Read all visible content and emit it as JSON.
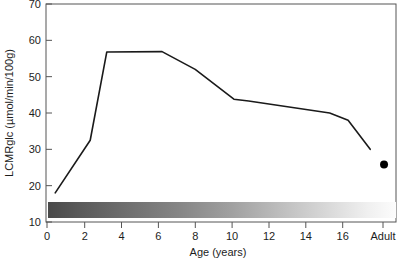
{
  "chart_data": {
    "type": "line",
    "title": "",
    "subtitle": "",
    "xlabel": "Age (years)",
    "ylabel": "LCMRglc (µmol/min/100g)",
    "xlim": [
      0,
      19
    ],
    "ylim": [
      10,
      70
    ],
    "grid": false,
    "legend": null,
    "x_tick_labels": [
      "0",
      "2",
      "4",
      "6",
      "8",
      "10",
      "12",
      "14",
      "16",
      "Adult"
    ],
    "x_tick_values": [
      0,
      2,
      4,
      6,
      8,
      10,
      12,
      14,
      16,
      18.2
    ],
    "y_tick_labels": [
      "10",
      "20",
      "30",
      "40",
      "50",
      "60",
      "70"
    ],
    "y_tick_values": [
      10,
      20,
      30,
      40,
      50,
      60,
      70
    ],
    "series": [
      {
        "name": "LCMRglc developmental curve",
        "style": "line",
        "color": "#1a1a1a",
        "x": [
          0.5,
          2.4,
          3.3,
          6.3,
          8.1,
          10.2,
          11.0,
          15.4,
          16.4,
          17.6
        ],
        "values": [
          18.0,
          32.5,
          56.8,
          56.9,
          52.0,
          43.8,
          43.3,
          40.0,
          38.0,
          30.0
        ]
      },
      {
        "name": "Adult value",
        "style": "point",
        "color": "#000000",
        "x": [
          18.35
        ],
        "values": [
          25.8
        ]
      }
    ],
    "annotations": [
      {
        "name": "myelination-gradient-bar",
        "type": "horizontal-gradient-band",
        "x_start": 0.0,
        "x_end": 18.9,
        "y_center": 14.4,
        "y_thickness": 3.0,
        "color_start": "#4f4f4f",
        "color_mid": "#9a9a9a",
        "color_end": "#fbfbfb"
      }
    ]
  },
  "colors": {
    "frame": "#4a4a4a",
    "line": "#1a1a1a",
    "dot": "#000000",
    "text": "#1d1d1d",
    "background": "#ffffff",
    "gradient_start": "#4f4f4f",
    "gradient_end": "#fbfbfb"
  }
}
